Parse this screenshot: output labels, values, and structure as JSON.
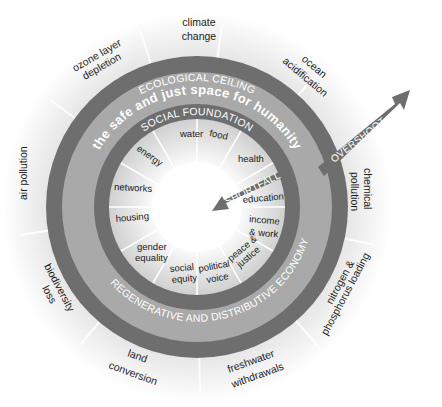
{
  "diagram": {
    "colors": {
      "outer_ring": "#6e6e6e",
      "middle_band": "#a9a9a9",
      "inner_ring": "#6e6e6e",
      "inner_area": "#d9d9d9",
      "arrow": "#6e6e6e",
      "text": "#1a1a1a",
      "band_text": "#ffffff"
    },
    "bands": {
      "ecological_ceiling": "ECOLOGICAL CEILING",
      "safe_space": "the safe  and just space for humanity",
      "social_foundation": "SOCIAL FOUNDATION",
      "regenerative_economy": "REGENERATIVE AND DISTRIBUTIVE ECONOMY"
    },
    "arrows": {
      "overshoot": "OVERSHOOT",
      "shortfall": "SHORTFALL"
    },
    "ecological_ceiling_labels": [
      {
        "line1": "climate",
        "line2": "change"
      },
      {
        "line1": "ocean",
        "line2": "acidification"
      },
      {
        "line1": "chemical",
        "line2": "pollution"
      },
      {
        "line1": "nitrogen &",
        "line2": "phosphorus loading"
      },
      {
        "line1": "freshwater",
        "line2": "withdrawals"
      },
      {
        "line1": "land",
        "line2": "conversion"
      },
      {
        "line1": "biodiversity",
        "line2": "loss"
      },
      {
        "line1": "air pollution",
        "line2": ""
      },
      {
        "line1": "ozone layer",
        "line2": "depletion"
      }
    ],
    "social_foundation_labels": [
      {
        "line1": "water",
        "line2": ""
      },
      {
        "line1": "food",
        "line2": ""
      },
      {
        "line1": "health",
        "line2": ""
      },
      {
        "line1": "education",
        "line2": ""
      },
      {
        "line1": "income",
        "line2": "& work"
      },
      {
        "line1": "peace &",
        "line2": "justice"
      },
      {
        "line1": "political",
        "line2": "voice"
      },
      {
        "line1": "social",
        "line2": "equity"
      },
      {
        "line1": "gender",
        "line2": "equality"
      },
      {
        "line1": "housing",
        "line2": ""
      },
      {
        "line1": "networks",
        "line2": ""
      },
      {
        "line1": "energy",
        "line2": ""
      }
    ]
  }
}
